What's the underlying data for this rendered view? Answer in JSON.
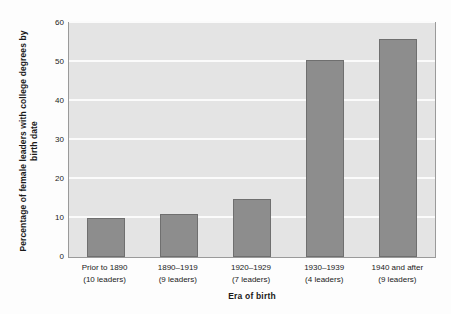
{
  "chart_data": {
    "type": "bar",
    "title": "",
    "xlabel": "Era of birth",
    "ylabel": "Percentage of female leaders with college degrees by birth date",
    "categories": [
      "Prior to 1890",
      "1890–1919",
      "1920–1929",
      "1930–1939",
      "1940 and after"
    ],
    "category_sublabels": [
      "(10 leaders)",
      "(9 leaders)",
      "(7 leaders)",
      "(4 leaders)",
      "(9 leaders)"
    ],
    "values": [
      10,
      11,
      15,
      50.5,
      56
    ],
    "ylim": [
      0,
      60
    ],
    "yticks": [
      0,
      10,
      20,
      30,
      40,
      50,
      60
    ],
    "ytick_labels": [
      "0",
      "10",
      "20",
      "30",
      "40",
      "50",
      "60"
    ],
    "grid": true,
    "legend": "none",
    "colors": {
      "bar_fill": "#8d8d8d",
      "bar_border": "#6f6f6f",
      "plot_background": "#e4e4e4",
      "gridline": "#fbfbfb",
      "axis_border": "#9a9a9a",
      "text": "#1a1a1a",
      "page_background": "#fdfdfd"
    }
  }
}
